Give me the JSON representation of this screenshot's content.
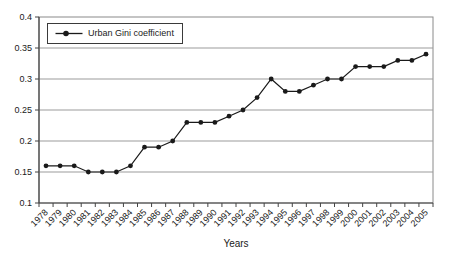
{
  "chart_data": {
    "type": "line",
    "title": "",
    "xlabel": "Years",
    "ylabel": "",
    "legend": {
      "label": "Urban Gini coefficient",
      "position": "top-left-inside",
      "marker": "filled-circle-on-line"
    },
    "categories": [
      "1978",
      "1979",
      "1980",
      "1981",
      "1982",
      "1983",
      "1984",
      "1985",
      "1986",
      "1987",
      "1988",
      "1989",
      "1990",
      "1991",
      "1992",
      "1993",
      "1994",
      "1995",
      "1996",
      "1997",
      "1998",
      "1999",
      "2000",
      "2001",
      "2002",
      "2003",
      "2004",
      "2005"
    ],
    "series": [
      {
        "name": "Urban Gini coefficient",
        "values": [
          0.16,
          0.16,
          0.16,
          0.15,
          0.15,
          0.15,
          0.16,
          0.19,
          0.19,
          0.2,
          0.23,
          0.23,
          0.23,
          0.24,
          0.25,
          0.27,
          0.3,
          0.28,
          0.28,
          0.29,
          0.3,
          0.3,
          0.32,
          0.32,
          0.32,
          0.33,
          0.33,
          0.34
        ]
      }
    ],
    "ylim": [
      0.1,
      0.4
    ],
    "ytick_step": 0.05,
    "ytick_labels": [
      "0.1",
      "0.15",
      "0.2",
      "0.25",
      "0.3",
      "0.35",
      "0.4"
    ],
    "grid": "horizontal",
    "x_label_rotation_deg": -45,
    "colors": {
      "series": "#1a1a1a",
      "gridline": "#9b9b9b",
      "plot_border": "#8a8a8a",
      "axis": "#444444",
      "background": "#ffffff",
      "text": "#1a1a1a"
    }
  }
}
